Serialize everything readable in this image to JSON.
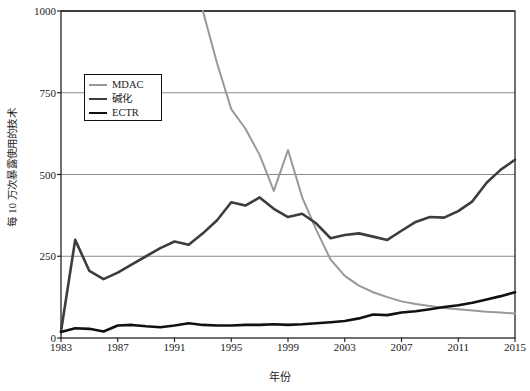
{
  "chart_data": {
    "type": "line",
    "title": "",
    "xlabel": "年份",
    "ylabel": "每 10 万次暴露使用的技术",
    "xlim": [
      1983,
      2015
    ],
    "ylim": [
      0,
      1000
    ],
    "grid": true,
    "legend_position": "upper-left",
    "x": [
      1983,
      1984,
      1985,
      1986,
      1987,
      1988,
      1989,
      1990,
      1991,
      1992,
      1993,
      1994,
      1995,
      1996,
      1997,
      1998,
      1999,
      2000,
      2001,
      2002,
      2003,
      2004,
      2005,
      2006,
      2007,
      2008,
      2009,
      2010,
      2011,
      2012,
      2013,
      2014,
      2015
    ],
    "yticks": [
      0,
      250,
      500,
      750,
      1000
    ],
    "xticks": [
      1983,
      1987,
      1991,
      1995,
      1999,
      2003,
      2007,
      2011,
      2015
    ],
    "series": [
      {
        "name": "MDAC",
        "color": "#999999",
        "width": 2.0,
        "values": [
          null,
          null,
          null,
          null,
          null,
          null,
          null,
          null,
          null,
          null,
          1000,
          840,
          700,
          640,
          560,
          450,
          575,
          430,
          330,
          240,
          190,
          160,
          140,
          125,
          112,
          104,
          98,
          92,
          88,
          84,
          80,
          78,
          75
        ]
      },
      {
        "name": "碱化",
        "color": "#3d3d3d",
        "width": 2.6,
        "values": [
          20,
          300,
          205,
          180,
          200,
          225,
          250,
          275,
          295,
          285,
          320,
          360,
          415,
          405,
          430,
          395,
          370,
          380,
          350,
          305,
          315,
          320,
          310,
          300,
          328,
          355,
          370,
          368,
          388,
          418,
          475,
          515,
          545
        ]
      },
      {
        "name": "ECTR",
        "color": "#111111",
        "width": 2.6,
        "values": [
          18,
          30,
          28,
          20,
          38,
          40,
          36,
          33,
          38,
          45,
          40,
          38,
          38,
          40,
          40,
          42,
          40,
          42,
          45,
          48,
          52,
          60,
          72,
          70,
          78,
          82,
          88,
          95,
          100,
          108,
          118,
          128,
          140
        ]
      }
    ]
  },
  "legend": {
    "items": [
      {
        "label": "MDAC"
      },
      {
        "label": "碱化"
      },
      {
        "label": "ECTR"
      }
    ]
  },
  "axis": {
    "y_ticks": [
      "0",
      "250",
      "500",
      "750",
      "1000"
    ],
    "x_ticks": [
      "1983",
      "1987",
      "1991",
      "1995",
      "1999",
      "2003",
      "2007",
      "2011",
      "2015"
    ],
    "y_title": "每 10 万次暴露使用的技术",
    "x_title": "年份"
  },
  "colors": {
    "grid": "#8a8a8a",
    "frame": "#111111",
    "mdac": "#999999",
    "alkali": "#3d3d3d",
    "ectr": "#111111"
  }
}
